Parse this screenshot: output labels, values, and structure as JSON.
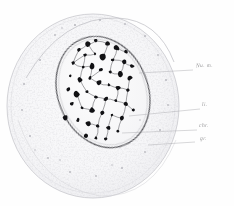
{
  "figure": {
    "medium": "pen-and-ink histological drawing",
    "background_color": "#fefefe",
    "ink_color": "#1a1a1a",
    "faint_ink_color": "#c9c9cc",
    "leader_color": "#a8a8ac"
  },
  "structures": {
    "cell_body": {
      "name": "cytoplasm-outline",
      "cx": 93,
      "cy": 106,
      "rx": 86,
      "ry": 92,
      "note": "large faint stippled round cell body"
    },
    "nucleus": {
      "name": "nucleus-outline",
      "cx": 103,
      "cy": 92,
      "rx": 45,
      "ry": 57,
      "rotation": -22,
      "note": "oval nucleus containing chromatin network"
    }
  },
  "labels": [
    {
      "id": "nuclear-membrane",
      "text": "Nu. m.",
      "x": 196,
      "y": 66,
      "leader_from_x": 193,
      "leader_from_y": 70,
      "leader_to_x": 139,
      "leader_to_y": 73
    },
    {
      "id": "linin",
      "text": "li.",
      "x": 202,
      "y": 105,
      "leader_from_x": 200,
      "leader_from_y": 109,
      "leader_to_x": 129,
      "leader_to_y": 116
    },
    {
      "id": "chromatin",
      "text": "chr.",
      "x": 199,
      "y": 126,
      "leader_from_x": 197,
      "leader_from_y": 130,
      "leader_to_x": 122,
      "leader_to_y": 133
    },
    {
      "id": "granules",
      "text": "gr.",
      "x": 200,
      "y": 139,
      "leader_from_x": 195,
      "leader_from_y": 142,
      "leader_to_x": 148,
      "leader_to_y": 145
    }
  ],
  "chart_data": {
    "type": "scatter",
    "xlabel": "",
    "ylabel": "",
    "chromatin_granules": [
      {
        "x": 88,
        "y": 44,
        "r": 2.4
      },
      {
        "x": 96,
        "y": 41,
        "r": 1.8
      },
      {
        "x": 108,
        "y": 44,
        "r": 2.2
      },
      {
        "x": 117,
        "y": 48,
        "r": 2.6
      },
      {
        "x": 126,
        "y": 52,
        "r": 1.9
      },
      {
        "x": 79,
        "y": 50,
        "r": 1.7
      },
      {
        "x": 85,
        "y": 55,
        "r": 1.5
      },
      {
        "x": 95,
        "y": 54,
        "r": 1.4
      },
      {
        "x": 103,
        "y": 57,
        "r": 3.0
      },
      {
        "x": 113,
        "y": 60,
        "r": 1.6
      },
      {
        "x": 124,
        "y": 62,
        "r": 2.8
      },
      {
        "x": 132,
        "y": 66,
        "r": 2.0
      },
      {
        "x": 73,
        "y": 63,
        "r": 1.6
      },
      {
        "x": 83,
        "y": 67,
        "r": 1.5
      },
      {
        "x": 92,
        "y": 66,
        "r": 2.6
      },
      {
        "x": 101,
        "y": 70,
        "r": 1.8
      },
      {
        "x": 110,
        "y": 72,
        "r": 1.5
      },
      {
        "x": 120,
        "y": 74,
        "r": 3.1
      },
      {
        "x": 130,
        "y": 78,
        "r": 2.1
      },
      {
        "x": 70,
        "y": 76,
        "r": 1.4
      },
      {
        "x": 80,
        "y": 80,
        "r": 2.4
      },
      {
        "x": 90,
        "y": 78,
        "r": 1.6
      },
      {
        "x": 99,
        "y": 83,
        "r": 2.9
      },
      {
        "x": 109,
        "y": 85,
        "r": 1.7
      },
      {
        "x": 118,
        "y": 88,
        "r": 2.3
      },
      {
        "x": 128,
        "y": 90,
        "r": 1.6
      },
      {
        "x": 68,
        "y": 89,
        "r": 1.9
      },
      {
        "x": 77,
        "y": 94,
        "r": 2.7
      },
      {
        "x": 87,
        "y": 92,
        "r": 1.5
      },
      {
        "x": 96,
        "y": 97,
        "r": 1.7
      },
      {
        "x": 106,
        "y": 99,
        "r": 2.5
      },
      {
        "x": 116,
        "y": 101,
        "r": 1.6
      },
      {
        "x": 126,
        "y": 104,
        "r": 2.0
      },
      {
        "x": 72,
        "y": 104,
        "r": 2.2
      },
      {
        "x": 82,
        "y": 108,
        "r": 1.5
      },
      {
        "x": 92,
        "y": 110,
        "r": 2.6
      },
      {
        "x": 102,
        "y": 113,
        "r": 1.8
      },
      {
        "x": 112,
        "y": 115,
        "r": 1.5
      },
      {
        "x": 122,
        "y": 118,
        "r": 2.4
      },
      {
        "x": 78,
        "y": 120,
        "r": 1.7
      },
      {
        "x": 88,
        "y": 124,
        "r": 2.3
      },
      {
        "x": 98,
        "y": 126,
        "r": 1.6
      },
      {
        "x": 108,
        "y": 128,
        "r": 2.0
      },
      {
        "x": 118,
        "y": 131,
        "r": 1.5
      },
      {
        "x": 86,
        "y": 136,
        "r": 1.8
      },
      {
        "x": 96,
        "y": 138,
        "r": 1.5
      },
      {
        "x": 106,
        "y": 139,
        "r": 1.7
      },
      {
        "x": 65,
        "y": 118,
        "r": 2.8
      },
      {
        "x": 133,
        "y": 110,
        "r": 1.5
      }
    ],
    "cytoplasm_granules": [
      {
        "x": 40,
        "y": 60,
        "r": 1.0
      },
      {
        "x": 55,
        "y": 35,
        "r": 0.9
      },
      {
        "x": 75,
        "y": 25,
        "r": 1.1
      },
      {
        "x": 100,
        "y": 20,
        "r": 1.0
      },
      {
        "x": 125,
        "y": 24,
        "r": 0.9
      },
      {
        "x": 145,
        "y": 36,
        "r": 1.0
      },
      {
        "x": 158,
        "y": 55,
        "r": 0.9
      },
      {
        "x": 166,
        "y": 80,
        "r": 1.0
      },
      {
        "x": 168,
        "y": 105,
        "r": 0.9
      },
      {
        "x": 160,
        "y": 130,
        "r": 1.0
      },
      {
        "x": 145,
        "y": 152,
        "r": 0.9
      },
      {
        "x": 122,
        "y": 168,
        "r": 1.0
      },
      {
        "x": 96,
        "y": 176,
        "r": 0.9
      },
      {
        "x": 70,
        "y": 172,
        "r": 1.0
      },
      {
        "x": 48,
        "y": 158,
        "r": 0.9
      },
      {
        "x": 30,
        "y": 136,
        "r": 1.0
      },
      {
        "x": 22,
        "y": 110,
        "r": 0.9
      },
      {
        "x": 24,
        "y": 84,
        "r": 1.0
      },
      {
        "x": 35,
        "y": 150,
        "r": 0.8
      },
      {
        "x": 60,
        "y": 160,
        "r": 0.8
      },
      {
        "x": 140,
        "y": 120,
        "r": 0.8
      },
      {
        "x": 150,
        "y": 95,
        "r": 0.8
      },
      {
        "x": 62,
        "y": 28,
        "r": 0.8
      },
      {
        "x": 112,
        "y": 165,
        "r": 0.8
      }
    ]
  }
}
